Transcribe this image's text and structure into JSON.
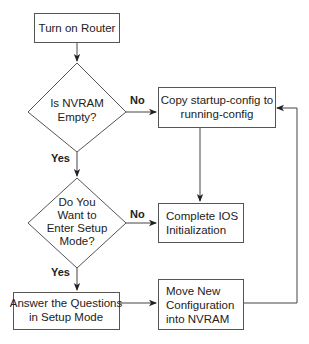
{
  "diagram": {
    "type": "flowchart",
    "nodes": {
      "turn_on_router": {
        "shape": "rect",
        "lines": [
          "Turn on Router"
        ]
      },
      "is_nvram_empty": {
        "shape": "diamond",
        "lines": [
          "Is NVRAM",
          "Empty?"
        ]
      },
      "copy_startup": {
        "shape": "rect",
        "lines": [
          "Copy startup-config to",
          "running-config"
        ]
      },
      "enter_setup": {
        "shape": "diamond",
        "lines": [
          "Do You",
          "Want to",
          "Enter Setup",
          "Mode?"
        ]
      },
      "complete_ios": {
        "shape": "rect",
        "lines": [
          "Complete IOS",
          "Initialization"
        ]
      },
      "answer_questions": {
        "shape": "rect",
        "lines": [
          "Answer the Questions",
          "in Setup Mode"
        ]
      },
      "move_config": {
        "shape": "rect",
        "lines": [
          "Move New",
          "Configuration",
          "into NVRAM"
        ]
      }
    },
    "edge_labels": {
      "nvram_no": "No",
      "nvram_yes": "Yes",
      "setup_no": "No",
      "setup_yes": "Yes"
    },
    "edges": [
      {
        "from": "turn_on_router",
        "to": "is_nvram_empty",
        "label": ""
      },
      {
        "from": "is_nvram_empty",
        "to": "copy_startup",
        "label": "No"
      },
      {
        "from": "is_nvram_empty",
        "to": "enter_setup",
        "label": "Yes"
      },
      {
        "from": "copy_startup",
        "to": "complete_ios",
        "label": ""
      },
      {
        "from": "enter_setup",
        "to": "complete_ios",
        "label": "No"
      },
      {
        "from": "enter_setup",
        "to": "answer_questions",
        "label": "Yes"
      },
      {
        "from": "answer_questions",
        "to": "move_config",
        "label": ""
      },
      {
        "from": "move_config",
        "to": "copy_startup",
        "label": ""
      }
    ],
    "colors": {
      "stroke": "#555555",
      "text": "#222222",
      "background": "#ffffff"
    }
  }
}
